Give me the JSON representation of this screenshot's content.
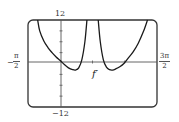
{
  "chart_data": {
    "type": "line",
    "title": "",
    "series": [
      {
        "name": "f'",
        "segments": [
          {
            "x": [
              -1.1,
              -1.0,
              -0.8,
              -0.6,
              -0.4,
              -0.2,
              0.0,
              0.2,
              0.4,
              0.6,
              0.75,
              0.9,
              1.05,
              1.2,
              1.3
            ],
            "y": [
              12,
              9.0,
              6.2,
              4.4,
              3.0,
              1.8,
              0.8,
              -0.3,
              -1.2,
              -1.7,
              -1.8,
              -1.2,
              1.0,
              6.0,
              12
            ]
          },
          {
            "x": [
              1.85,
              1.95,
              2.1,
              2.25,
              2.4,
              2.55,
              2.7,
              2.9,
              3.1,
              3.3,
              3.55,
              3.8,
              4.05,
              4.25
            ],
            "y": [
              12,
              6.0,
              1.0,
              -1.0,
              -1.7,
              -1.8,
              -1.5,
              -0.9,
              0.0,
              1.4,
              3.2,
              5.6,
              8.8,
              12
            ]
          }
        ]
      }
    ],
    "xlim": [
      -1.5708,
      4.7124
    ],
    "ylim": [
      -12,
      12
    ],
    "x_tick_labels": [
      {
        "value": -1.5708,
        "num": "π",
        "den": "2",
        "sign": "−"
      },
      {
        "value": 4.7124,
        "num": "3π",
        "den": "2",
        "sign": ""
      }
    ],
    "y_tick_labels": [
      {
        "value": 12,
        "label": "12"
      },
      {
        "value": -12,
        "label": "−12"
      }
    ],
    "y_minor_ticks": [
      9,
      6,
      3,
      -3,
      -6,
      -9
    ],
    "x_minor_ticks": [
      1.5708,
      3.1416
    ],
    "curve_label": "f′",
    "grid": false,
    "legend": "none",
    "colors": {
      "curve": "#1a1a1a",
      "axes": "#555555",
      "frame": "#333333"
    }
  },
  "labels": {
    "y_top": "12",
    "y_bottom": "−12",
    "x_left_sign": "−",
    "x_left_num": "π",
    "x_left_den": "2",
    "x_right_num": "3π",
    "x_right_den": "2",
    "curve": "f′"
  }
}
